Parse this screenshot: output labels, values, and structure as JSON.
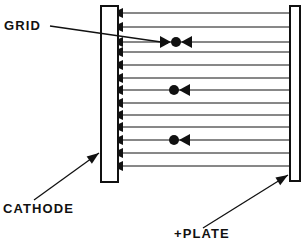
{
  "figure": {
    "type": "schematic-diagram",
    "width": 304,
    "height": 243,
    "background_color": "#ffffff",
    "ink_color": "#111111"
  },
  "labels": {
    "grid": "GRID",
    "cathode": "CATHODE",
    "plate": "+PLATE"
  },
  "electrodes": [
    {
      "name": "cathode-bar",
      "label_ref": "cathode",
      "x": 101,
      "y": 6,
      "width": 17,
      "height": 176,
      "fill": "#ffffff",
      "stroke": "#111111"
    },
    {
      "name": "plate-bar",
      "label_ref": "plate",
      "x": 290,
      "y": 6,
      "width": 10,
      "height": 175,
      "fill": "#ffffff",
      "stroke": "#111111"
    }
  ],
  "field_lines": {
    "count": 13,
    "x_start": 290,
    "x_end": 119,
    "direction": "right-to-left",
    "y_positions": [
      13,
      27,
      42,
      52,
      65,
      78,
      90,
      103,
      115,
      127,
      140,
      153,
      166
    ],
    "arrowhead_at": "left",
    "stroke": "#111111",
    "stroke_width": 1
  },
  "electrons": [
    {
      "name": "electron-1",
      "cx": 176,
      "cy": 42,
      "r": 5,
      "line_index": 2,
      "arrow_left": true,
      "arrow_right": true
    },
    {
      "name": "electron-2",
      "cx": 174,
      "cy": 90,
      "r": 5,
      "line_index": 6,
      "arrow_left": false,
      "arrow_right": true
    },
    {
      "name": "electron-3",
      "cx": 174,
      "cy": 140,
      "r": 5,
      "line_index": 10,
      "arrow_left": false,
      "arrow_right": true
    }
  ],
  "leaders": [
    {
      "name": "grid-leader",
      "label_ref": "grid",
      "from_x": 50,
      "from_y": 26,
      "to_x": 168,
      "to_y": 43,
      "arrowhead": false
    },
    {
      "name": "cathode-leader",
      "label_ref": "cathode",
      "from_x": 34,
      "from_y": 200,
      "to_x": 99,
      "to_y": 153,
      "arrowhead": true
    },
    {
      "name": "plate-leader",
      "label_ref": "plate",
      "from_x": 203,
      "from_y": 228,
      "to_x": 288,
      "to_y": 175,
      "arrowhead": true
    }
  ],
  "label_positions": {
    "grid": {
      "x": 4,
      "y": 30
    },
    "cathode": {
      "x": 3,
      "y": 213
    },
    "plate": {
      "x": 174,
      "y": 238
    }
  }
}
